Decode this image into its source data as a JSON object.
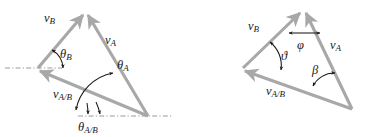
{
  "figure": {
    "kind": "vector-triangle-diagram-pair",
    "background_color": "#ffffff",
    "vector_color": "#a8a8a8",
    "annotation_color": "#1a1a1a",
    "dashdot_color": "#9a9a9a"
  },
  "left_diagram": {
    "name": "relative-velocity-triangle-theta",
    "vectors": [
      {
        "id": "vB",
        "base": "v",
        "sub": "B"
      },
      {
        "id": "vA",
        "base": "v",
        "sub": "A"
      },
      {
        "id": "vAB",
        "base": "v",
        "sub": "A/B"
      }
    ],
    "angles": [
      {
        "id": "thetaB",
        "base": "θ",
        "sub": "B"
      },
      {
        "id": "thetaA",
        "base": "θ",
        "sub": "A"
      },
      {
        "id": "thetaAB",
        "base": "θ",
        "sub": "A/B"
      }
    ],
    "labels": {
      "vB_base": "v",
      "vB_sub": "B",
      "vA_base": "v",
      "vA_sub": "A",
      "vAB_base": "v",
      "vAB_sub": "A/B",
      "thetaB_base": "θ",
      "thetaB_sub": "B",
      "thetaA_base": "θ",
      "thetaA_sub": "A",
      "thetaAB_base": "θ",
      "thetaAB_sub": "A/B"
    },
    "reference_lines": [
      "horizontal-dashdot-at-left-vertex",
      "horizontal-dashdot-at-bottom-right-vertex"
    ]
  },
  "right_diagram": {
    "name": "relative-velocity-triangle-interior-angles",
    "vectors": [
      {
        "id": "vB",
        "base": "v",
        "sub": "B"
      },
      {
        "id": "vA",
        "base": "v",
        "sub": "A"
      },
      {
        "id": "vAB",
        "base": "v",
        "sub": "A/B"
      }
    ],
    "angles": [
      {
        "id": "phi",
        "base": "φ",
        "sub": ""
      },
      {
        "id": "vartheta",
        "base": "ϑ",
        "sub": ""
      },
      {
        "id": "beta",
        "base": "β",
        "sub": ""
      }
    ],
    "labels": {
      "vB_base": "v",
      "vB_sub": "B",
      "vA_base": "v",
      "vA_sub": "A",
      "vAB_base": "v",
      "vAB_sub": "A/B",
      "phi": "φ",
      "vartheta": "ϑ",
      "beta": "β"
    },
    "reference_lines": []
  }
}
